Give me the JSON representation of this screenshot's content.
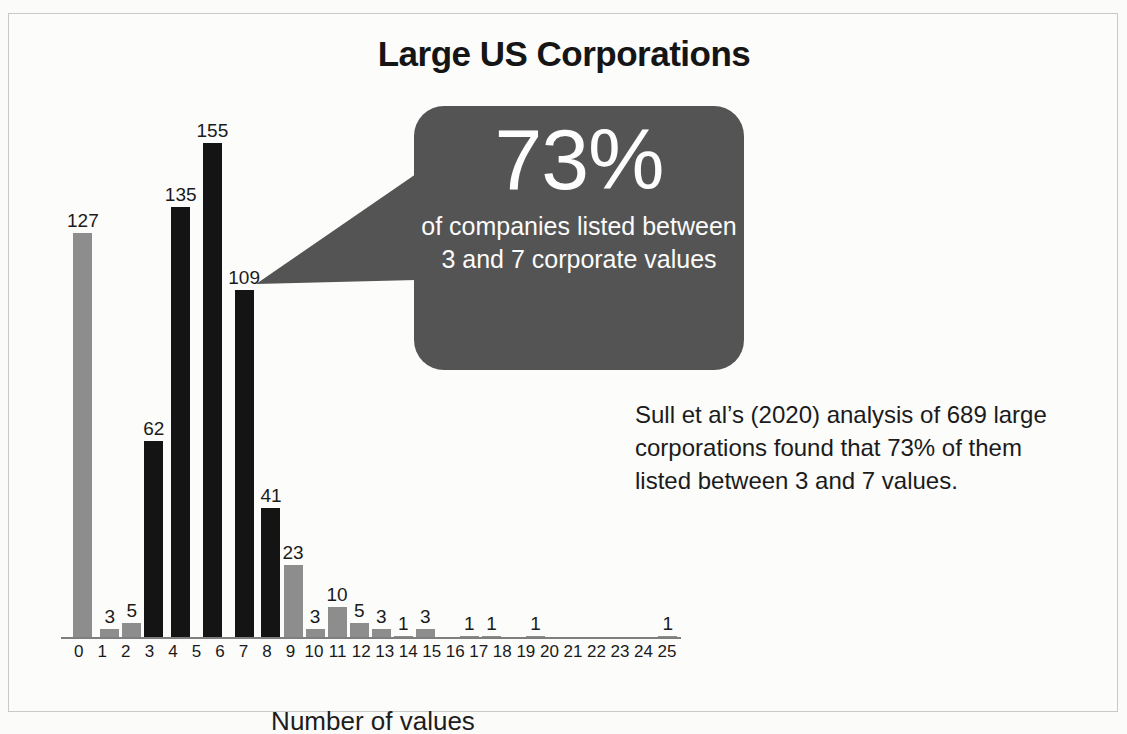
{
  "figure": {
    "title": "Large US Corporations",
    "border_color": "#c9c9c9",
    "background": "#fcfcfb"
  },
  "callout": {
    "headline": "73%",
    "caption": "of companies listed between 3 and 7 corporate values",
    "background_color": "#545454",
    "text_color": "#fbfbfb"
  },
  "annotation": {
    "text": "Sull et al’s (2020) analysis of 689 large corporations found that 73% of them listed between 3 and 7 values."
  },
  "chart_data": {
    "type": "bar",
    "title": "Large US Corporations",
    "xlabel": "Number of values",
    "ylabel": "",
    "ylim": [
      0,
      175
    ],
    "grid": false,
    "legend": "none",
    "highlight_range": [
      3,
      7
    ],
    "highlight_color": "#141414",
    "base_color": "#8d8d8d",
    "total_companies": 689,
    "categories": [
      "0",
      "1",
      "2",
      "3",
      "4",
      "5",
      "6",
      "7",
      "8",
      "9",
      "10",
      "11",
      "12",
      "13",
      "14",
      "15",
      "16",
      "17",
      "18",
      "19",
      "20",
      "21",
      "22",
      "23",
      "24",
      "25"
    ],
    "values": [
      127,
      3,
      5,
      62,
      135,
      155,
      109,
      41,
      23,
      3,
      10,
      5,
      3,
      1,
      3,
      0,
      1,
      1,
      0,
      1,
      0,
      0,
      0,
      0,
      0,
      1
    ],
    "data_labels": [
      "127",
      "3",
      "5",
      "62",
      "135",
      "155",
      "109",
      "41",
      "23",
      "3",
      "10",
      "5",
      "3",
      "1",
      "3",
      "",
      "1",
      "1",
      "",
      "1",
      "",
      "",
      "",
      "",
      "",
      "1"
    ],
    "highlighted": [
      false,
      false,
      false,
      true,
      true,
      true,
      true,
      true,
      false,
      false,
      false,
      false,
      false,
      false,
      false,
      false,
      false,
      false,
      false,
      false,
      false,
      false,
      false,
      false,
      false,
      false
    ]
  }
}
